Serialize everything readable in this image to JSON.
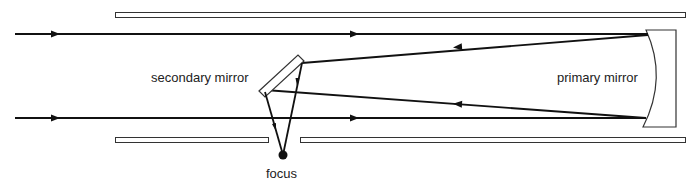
{
  "labels": {
    "secondary_mirror": "secondary mirror",
    "primary_mirror": "primary mirror",
    "focus": "focus"
  },
  "colors": {
    "line": "#111111",
    "text": "#222222",
    "background": "#ffffff"
  },
  "components": [
    {
      "name": "tube-wall-top",
      "type": "tube wall"
    },
    {
      "name": "tube-wall-bottom-left",
      "type": "tube wall"
    },
    {
      "name": "tube-wall-bottom-right",
      "type": "tube wall"
    },
    {
      "name": "primary-mirror",
      "type": "concave mirror"
    },
    {
      "name": "secondary-mirror",
      "type": "flat diagonal mirror"
    },
    {
      "name": "focus-point",
      "type": "focal point"
    }
  ],
  "rays": [
    {
      "name": "incoming-ray-top",
      "direction": "right"
    },
    {
      "name": "incoming-ray-bottom",
      "direction": "right"
    },
    {
      "name": "reflected-ray-top",
      "direction": "left"
    },
    {
      "name": "reflected-ray-bottom",
      "direction": "left"
    },
    {
      "name": "diverted-ray-left",
      "direction": "down"
    },
    {
      "name": "diverted-ray-right",
      "direction": "down"
    }
  ]
}
